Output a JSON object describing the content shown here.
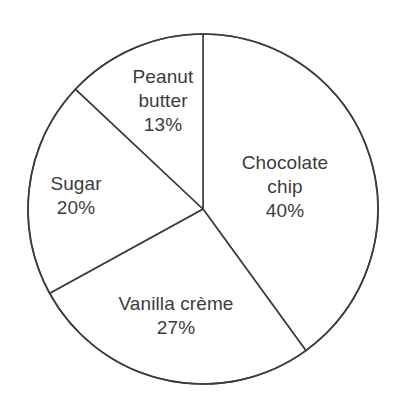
{
  "chart_data": {
    "type": "pie",
    "title": "",
    "subtitle": "",
    "xlabel": "",
    "ylabel": "",
    "legend_position": "none",
    "grid": false,
    "labels_inside_slices": true,
    "start_angle_deg": 0,
    "direction": "clockwise",
    "categories": [
      "Chocolate chip",
      "Vanilla crème",
      "Sugar",
      "Peanut butter"
    ],
    "values": [
      40,
      27,
      20,
      13
    ],
    "value_unit": "%",
    "slices": [
      {
        "name": "Chocolate chip",
        "value": 40,
        "percent_text": "40%",
        "label_lines": [
          "Chocolate",
          "chip",
          "40%"
        ],
        "start_angle_deg": 0,
        "end_angle_deg": 144,
        "fill": "#ffffff",
        "stroke": "#3c3c3c",
        "label_x": 285,
        "label_y": 187
      },
      {
        "name": "Vanilla crème",
        "value": 27,
        "percent_text": "27%",
        "label_lines": [
          "Vanilla crème",
          "27%"
        ],
        "start_angle_deg": 144,
        "end_angle_deg": 241.2,
        "fill": "#ffffff",
        "stroke": "#3c3c3c",
        "label_x": 176,
        "label_y": 316
      },
      {
        "name": "Sugar",
        "value": 20,
        "percent_text": "20%",
        "label_lines": [
          "Sugar",
          "20%"
        ],
        "start_angle_deg": 241.2,
        "end_angle_deg": 313.2,
        "fill": "#ffffff",
        "stroke": "#3c3c3c",
        "label_x": 76,
        "label_y": 196
      },
      {
        "name": "Peanut butter",
        "value": 13,
        "percent_text": "13%",
        "label_lines": [
          "Peanut",
          "butter",
          "13%"
        ],
        "start_angle_deg": 313.2,
        "end_angle_deg": 360,
        "fill": "#ffffff",
        "stroke": "#3c3c3c",
        "label_x": 163,
        "label_y": 101
      }
    ],
    "geometry": {
      "center_x": 203,
      "center_y": 209,
      "radius": 175
    },
    "colors": {
      "background": "#ffffff",
      "slice_fill": "#ffffff",
      "stroke": "#3c3c3c",
      "text": "#3c3c3c"
    }
  },
  "labels": {
    "chocolate_chip": {
      "line1": "Chocolate",
      "line2": "chip",
      "line3": "40%"
    },
    "vanilla_creme": {
      "line1": "Vanilla crème",
      "line2": "27%"
    },
    "sugar": {
      "line1": "Sugar",
      "line2": "20%"
    },
    "peanut_butter": {
      "line1": "Peanut",
      "line2": "butter",
      "line3": "13%"
    }
  }
}
